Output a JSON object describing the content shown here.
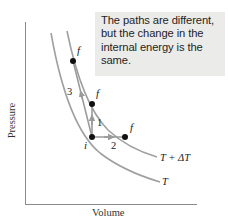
{
  "callout": {
    "lines": [
      "The paths are different,",
      "but the change in the",
      "internal energy is the",
      "same."
    ],
    "background": "#ebebe9"
  },
  "axes": {
    "x_label": "Volume",
    "y_label": "Pressure",
    "color": "#888888"
  },
  "isotherms": [
    {
      "label": "T",
      "color": "#9a9a9a"
    },
    {
      "label": "T + ΔT",
      "color": "#9a9a9a"
    }
  ],
  "points": {
    "initial": {
      "label": "i"
    },
    "finals": [
      {
        "label": "f"
      },
      {
        "label": "f"
      },
      {
        "label": "f"
      }
    ]
  },
  "paths": [
    {
      "label": "1",
      "description": "vertical, i to f on T+ΔT"
    },
    {
      "label": "2",
      "description": "horizontal, i to f on T+ΔT"
    },
    {
      "label": "3",
      "description": "diagonal, i to f on T+ΔT"
    }
  ],
  "path_color": "#9a9a9a",
  "point_color": "#111111"
}
